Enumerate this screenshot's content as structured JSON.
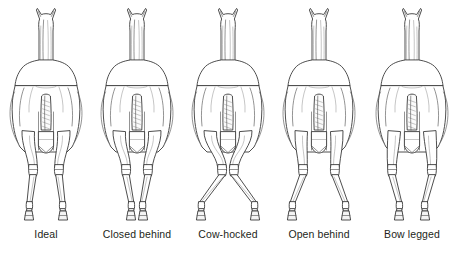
{
  "figure": {
    "background_color": "#ffffff",
    "line_color": "#3a3a3a",
    "label_color": "#231f20",
    "view": "rear view",
    "panels": [
      {
        "id": "ideal",
        "label": "Ideal",
        "center_x": 46,
        "hock_offset": 0,
        "foot_offset": 0,
        "stance_width": 17,
        "description": "hind legs straight and plumb, evenly spaced"
      },
      {
        "id": "closed-behind",
        "label": "Closed behind",
        "center_x": 137,
        "hock_offset": -2,
        "foot_offset": -5,
        "stance_width": 11,
        "description": "hind legs set close together, narrow base"
      },
      {
        "id": "cow-hocked",
        "label": "Cow-hocked",
        "center_x": 228,
        "hock_offset": -7,
        "foot_offset": 6,
        "stance_width": 21,
        "description": "hocks turn inward toward each other, feet point outward"
      },
      {
        "id": "open-behind",
        "label": "Open behind",
        "center_x": 319,
        "hock_offset": 3,
        "foot_offset": 4,
        "stance_width": 23,
        "description": "hind legs set wide apart, broad base"
      },
      {
        "id": "bow-legged",
        "label": "Bow legged",
        "center_x": 412,
        "hock_offset": 7,
        "foot_offset": -3,
        "stance_width": 16,
        "description": "hocks bow outward, cannons angle back inward"
      }
    ]
  }
}
